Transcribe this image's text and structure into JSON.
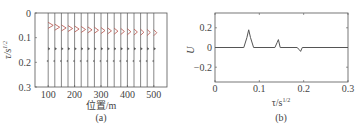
{
  "chart_data": [
    {
      "panel": "(a)",
      "type": "line",
      "title": "",
      "xlabel": "位置/m",
      "ylabel": "τ/s^1/2",
      "ylabel_main": "τ/s",
      "ylabel_sup": "1/2",
      "xlim": [
        50,
        550
      ],
      "ylim": [
        0.3,
        0
      ],
      "y_inverted": true,
      "xticks": [
        "100",
        "200",
        "300",
        "400",
        "500"
      ],
      "yticks": [
        "0",
        "0.1",
        "0.2",
        "0.3"
      ],
      "grid": false,
      "trace_positions_m": [
        100,
        125,
        150,
        175,
        200,
        225,
        250,
        275,
        300,
        325,
        350,
        375,
        400,
        425,
        450,
        475,
        500
      ],
      "events": [
        {
          "name": "event-1",
          "tau_start": 0.05,
          "tau_end": 0.08,
          "note": "moveout arrivals, red wiggles"
        },
        {
          "name": "event-2",
          "tau": 0.145
        },
        {
          "name": "event-3",
          "tau": 0.195
        }
      ],
      "caption": "(a)"
    },
    {
      "panel": "(b)",
      "type": "line",
      "title": "",
      "xlabel": "τ/s^1/2",
      "xlabel_main": "τ/s",
      "xlabel_sup": "1/2",
      "ylabel": "U",
      "xlim": [
        0,
        0.3
      ],
      "ylim": [
        -0.35,
        0.35
      ],
      "xticks": [
        "0",
        "0.1",
        "0.2",
        "0.3"
      ],
      "yticks": [
        "0.2",
        "0",
        "-0.2"
      ],
      "grid": false,
      "series": [
        {
          "name": "U(τ)",
          "x": [
            0,
            0.065,
            0.072,
            0.076,
            0.08,
            0.087,
            0.135,
            0.14,
            0.143,
            0.147,
            0.185,
            0.19,
            0.193,
            0.197,
            0.3
          ],
          "values": [
            0,
            0,
            0.1,
            0.18,
            0.1,
            0,
            0,
            0.05,
            0.08,
            0,
            0,
            -0.02,
            -0.04,
            0,
            0
          ]
        }
      ],
      "caption": "(b)"
    }
  ]
}
